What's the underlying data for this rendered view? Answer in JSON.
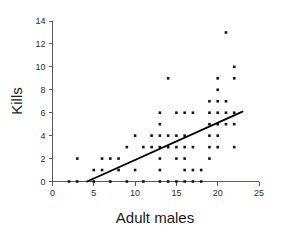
{
  "chart_data": {
    "type": "scatter",
    "title": "",
    "xlabel": "Adult males",
    "ylabel": "Kills",
    "xlim": [
      0,
      25
    ],
    "ylim": [
      0,
      14
    ],
    "xticks": [
      0,
      5,
      10,
      15,
      20,
      25
    ],
    "yticks": [
      0,
      2,
      4,
      6,
      8,
      10,
      12,
      14
    ],
    "xtick_labels": [
      "0",
      "5",
      "10",
      "15",
      "20",
      "25"
    ],
    "ytick_labels": [
      "0",
      "2",
      "4",
      "6",
      "8",
      "10",
      "12",
      "14"
    ],
    "grid": false,
    "legend": null,
    "marker": "square-dot",
    "points": [
      [
        2,
        0
      ],
      [
        3,
        0
      ],
      [
        3,
        2
      ],
      [
        5,
        0
      ],
      [
        5,
        1
      ],
      [
        6,
        1
      ],
      [
        6,
        2
      ],
      [
        7,
        0
      ],
      [
        7,
        2
      ],
      [
        8,
        1
      ],
      [
        8,
        2
      ],
      [
        9,
        0
      ],
      [
        9,
        3
      ],
      [
        10,
        1
      ],
      [
        10,
        4
      ],
      [
        11,
        0
      ],
      [
        11,
        3
      ],
      [
        12,
        3
      ],
      [
        12,
        4
      ],
      [
        13,
        0
      ],
      [
        13,
        1
      ],
      [
        13,
        2
      ],
      [
        13,
        3
      ],
      [
        13,
        4
      ],
      [
        13,
        5
      ],
      [
        13,
        6
      ],
      [
        14,
        0
      ],
      [
        14,
        3
      ],
      [
        14,
        4
      ],
      [
        14,
        9
      ],
      [
        15,
        0
      ],
      [
        15,
        2
      ],
      [
        15,
        3
      ],
      [
        15,
        4
      ],
      [
        15,
        6
      ],
      [
        16,
        0
      ],
      [
        16,
        1
      ],
      [
        16,
        2
      ],
      [
        16,
        3
      ],
      [
        16,
        4
      ],
      [
        16,
        6
      ],
      [
        17,
        0
      ],
      [
        17,
        1
      ],
      [
        17,
        3
      ],
      [
        17,
        6
      ],
      [
        18,
        0
      ],
      [
        18,
        1
      ],
      [
        19,
        2
      ],
      [
        19,
        3
      ],
      [
        19,
        4
      ],
      [
        19,
        5
      ],
      [
        19,
        6
      ],
      [
        19,
        7
      ],
      [
        20,
        3
      ],
      [
        20,
        4
      ],
      [
        20,
        5
      ],
      [
        20,
        6
      ],
      [
        20,
        7
      ],
      [
        20,
        8
      ],
      [
        20,
        9
      ],
      [
        21,
        5
      ],
      [
        21,
        6
      ],
      [
        21,
        7
      ],
      [
        21,
        13
      ],
      [
        22,
        3
      ],
      [
        22,
        5
      ],
      [
        22,
        6
      ],
      [
        22,
        9
      ],
      [
        22,
        10
      ]
    ],
    "trend_line": {
      "x0": 4.2,
      "y0": 0,
      "x1": 23.0,
      "y1": 6.1,
      "slope": 0.3245,
      "intercept": -1.363
    }
  },
  "axes": {
    "x_title": "Adult males",
    "y_title": "Kills"
  }
}
